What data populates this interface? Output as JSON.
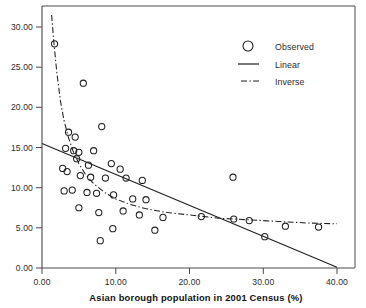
{
  "chart_data": {
    "type": "scatter",
    "title": "",
    "xlabel": "Asian borough population in 2001 Census (%)",
    "ylabel": "",
    "xlim": [
      0,
      40
    ],
    "ylim": [
      0,
      30
    ],
    "grid": false,
    "legend_position": "top-right",
    "xticks": [
      "0.00",
      "10.00",
      "20.00",
      "30.00",
      "40.00"
    ],
    "xtick_values": [
      0,
      10,
      20,
      30,
      40
    ],
    "yticks": [
      "0.00",
      "5.00",
      "10.00",
      "15.00",
      "20.00",
      "25.00",
      "30.00"
    ],
    "ytick_values": [
      0,
      5,
      10,
      15,
      20,
      25,
      30
    ],
    "series": [
      {
        "name": "Observed",
        "type": "scatter",
        "marker": "open-circle",
        "points": [
          [
            1.7,
            27.9
          ],
          [
            5.6,
            23.0
          ],
          [
            3.6,
            16.9
          ],
          [
            4.5,
            16.3
          ],
          [
            8.1,
            17.6
          ],
          [
            3.2,
            14.9
          ],
          [
            4.3,
            14.6
          ],
          [
            5.0,
            14.4
          ],
          [
            4.7,
            13.6
          ],
          [
            7.0,
            14.6
          ],
          [
            6.3,
            12.8
          ],
          [
            9.4,
            13.0
          ],
          [
            10.6,
            12.3
          ],
          [
            2.8,
            12.4
          ],
          [
            3.4,
            12.0
          ],
          [
            5.2,
            11.5
          ],
          [
            6.6,
            11.3
          ],
          [
            8.6,
            11.2
          ],
          [
            11.4,
            11.2
          ],
          [
            13.6,
            10.9
          ],
          [
            25.9,
            11.3
          ],
          [
            3.0,
            9.6
          ],
          [
            4.1,
            9.7
          ],
          [
            6.1,
            9.4
          ],
          [
            7.4,
            9.3
          ],
          [
            9.7,
            9.1
          ],
          [
            12.3,
            8.6
          ],
          [
            14.1,
            8.5
          ],
          [
            5.0,
            7.5
          ],
          [
            7.7,
            6.9
          ],
          [
            11.0,
            7.1
          ],
          [
            13.2,
            6.6
          ],
          [
            16.4,
            6.3
          ],
          [
            21.6,
            6.4
          ],
          [
            26.0,
            6.1
          ],
          [
            28.1,
            5.9
          ],
          [
            9.6,
            4.9
          ],
          [
            15.3,
            4.7
          ],
          [
            30.2,
            3.9
          ],
          [
            33.0,
            5.2
          ],
          [
            37.5,
            5.1
          ],
          [
            7.9,
            3.4
          ]
        ]
      },
      {
        "name": "Linear",
        "type": "line",
        "style": "solid",
        "endpoints": [
          [
            0,
            15.5
          ],
          [
            40,
            0.1
          ]
        ]
      },
      {
        "name": "Inverse",
        "type": "line",
        "style": "dash-dot",
        "description": "inverse fit y = a + b/x, descending steeply then flattening near y=5.4",
        "points": [
          [
            1.3,
            31.5
          ],
          [
            1.6,
            28.2
          ],
          [
            2.0,
            24.4
          ],
          [
            2.5,
            20.8
          ],
          [
            3.0,
            18.3
          ],
          [
            3.6,
            16.2
          ],
          [
            4.2,
            14.6
          ],
          [
            5.0,
            13.0
          ],
          [
            6.0,
            11.5
          ],
          [
            7.0,
            10.5
          ],
          [
            8.5,
            9.4
          ],
          [
            10.0,
            8.6
          ],
          [
            12.0,
            7.9
          ],
          [
            14.0,
            7.4
          ],
          [
            17.0,
            6.9
          ],
          [
            20.0,
            6.6
          ],
          [
            24.0,
            6.2
          ],
          [
            28.0,
            6.0
          ],
          [
            32.0,
            5.8
          ],
          [
            36.0,
            5.6
          ],
          [
            40.0,
            5.5
          ]
        ]
      }
    ]
  },
  "legend": {
    "items": [
      {
        "label": "Observed",
        "symbol": "open-circle"
      },
      {
        "label": "Linear",
        "symbol": "solid-line"
      },
      {
        "label": "Inverse",
        "symbol": "dash-dot-line"
      }
    ]
  },
  "axes": {
    "x_title": "Asian borough population in 2001 Census (%)",
    "x_tick_labels": [
      "0.00",
      "10.00",
      "20.00",
      "30.00",
      "40.00"
    ],
    "y_tick_labels": [
      "0.00",
      "5.00",
      "10.00",
      "15.00",
      "20.00",
      "25.00",
      "30.00"
    ]
  },
  "colors": {
    "ink": "#1f1f1f",
    "axis": "#4a4a4a",
    "background": "#ffffff"
  }
}
